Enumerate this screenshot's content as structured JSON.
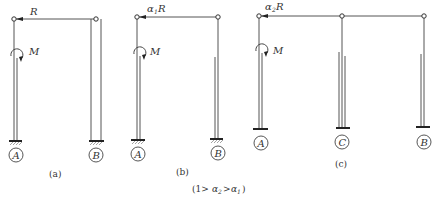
{
  "figure": {
    "panels": [
      {
        "caption": "(a)",
        "force_label": "R",
        "force_prefix": "",
        "force_sub": "",
        "moment_label": "M",
        "columns": [
          "A",
          "B"
        ]
      },
      {
        "caption": "(b)",
        "force_label": "R",
        "force_prefix": "α",
        "force_sub": "1",
        "moment_label": "M",
        "columns": [
          "A",
          "B"
        ]
      },
      {
        "caption": "(c)",
        "force_label": "R",
        "force_prefix": "α",
        "force_sub": "2",
        "moment_label": "M",
        "columns": [
          "A",
          "C",
          "B"
        ]
      }
    ],
    "footnote": {
      "open": "(1>",
      "a2": "α",
      "a2_sub": "2",
      "gt": ">",
      "a1": "α",
      "a1_sub": "1",
      "close": ")"
    }
  }
}
